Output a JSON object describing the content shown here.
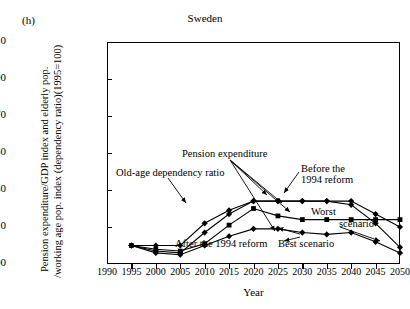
{
  "panel_label": "(h)",
  "title": "Sweden",
  "axis": {
    "ylabel_line1": "Pension expenditure/GDP index and elderly pop.",
    "ylabel_line2": "/working age pop. index (dependency ratio)(1995=100)",
    "xlabel": "Year",
    "yticks": [
      90,
      110,
      130,
      150,
      170,
      190,
      210
    ],
    "xticks": [
      1990,
      1995,
      2000,
      2005,
      2010,
      2015,
      2020,
      2025,
      2030,
      2035,
      2040,
      2045,
      2050
    ]
  },
  "annotations": {
    "pension_expenditure": "Pension expenditure",
    "old_age_dependency": "Old-age dependency ratio",
    "before_reform_l1": "Before the",
    "before_reform_l2": "1994 reform",
    "after_reform": "After the 1994 reform",
    "worst": "Worst",
    "scenario": "scenario",
    "best_scenario": "Best scenario"
  },
  "chart_data": {
    "type": "line",
    "title": "Sweden",
    "xlabel": "Year",
    "ylabel": "Pension expenditure/GDP index and elderly pop. /working age pop. index (dependency ratio)(1995=100)",
    "xlim": [
      1990,
      2050
    ],
    "ylim": [
      90,
      210
    ],
    "grid": false,
    "legend": "annotated-inline",
    "x": [
      1995,
      2000,
      2005,
      2010,
      2015,
      2020,
      2025,
      2030,
      2035,
      2040,
      2045,
      2050
    ],
    "series": [
      {
        "name": "Old-age dependency ratio",
        "marker": "diamond",
        "values": [
          100,
          100,
          100,
          112,
          119,
          124,
          124,
          124,
          124,
          124,
          117,
          110
        ]
      },
      {
        "name": "Pension expenditure, before the 1994 reform",
        "marker": "diamond",
        "values": [
          100,
          97,
          96,
          107,
          117,
          124,
          124,
          124,
          124,
          122,
          112,
          99
        ]
      },
      {
        "name": "Pension expenditure, after the 1994 reform - worst scenario",
        "marker": "square",
        "values": [
          100,
          98,
          97,
          101,
          111,
          120,
          116,
          114,
          114,
          114,
          114,
          114
        ]
      },
      {
        "name": "Pension expenditure, after the 1994 reform - best scenario",
        "marker": "diamond",
        "values": [
          100,
          96,
          95,
          100,
          105,
          109,
          109,
          107,
          106,
          107,
          102,
          96
        ]
      }
    ]
  }
}
